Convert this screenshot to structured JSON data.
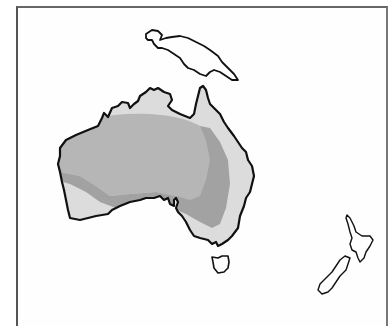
{
  "map": {
    "region": "Australasia",
    "landmasses": [
      {
        "name": "Australia",
        "shaded": true
      },
      {
        "name": "New Guinea",
        "shaded": false
      },
      {
        "name": "Tasmania",
        "shaded": false
      },
      {
        "name": "New Zealand North Island",
        "shaded": false
      },
      {
        "name": "New Zealand South Island",
        "shaded": false
      }
    ],
    "shading": {
      "light": "#dcdcdc",
      "medium": "#b6b6b6",
      "dark": "#a2a2a2"
    },
    "outline_color": "#111111",
    "labels": []
  }
}
